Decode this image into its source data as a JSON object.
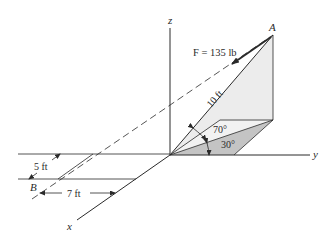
{
  "figure": {
    "type": "3D statics force diagram",
    "axes": {
      "x": "x",
      "y": "y",
      "z": "z"
    },
    "points": {
      "A": "A",
      "B": "B"
    },
    "force_label": "F = 135 lb",
    "length_label": "10 ft",
    "angle_elevation": "70°",
    "angle_plane": "30°",
    "dim_5ft": "5 ft",
    "dim_7ft": "7 ft"
  },
  "colors": {
    "line": "#2a2a2a",
    "plane_fill_light": "#ebebeb",
    "plane_fill_dark": "#c4c4c4"
  }
}
